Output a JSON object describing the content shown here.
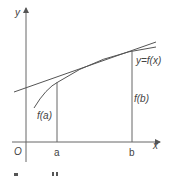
{
  "diagram": {
    "type": "secant-line-graph",
    "axes": {
      "x_label": "x",
      "y_label": "y",
      "origin_label": "O"
    },
    "points": {
      "a_label": "a",
      "b_label": "b"
    },
    "values": {
      "fa_label": "f(a)",
      "fb_label": "f(b)"
    },
    "curve_label": "y=f(x)",
    "colors": {
      "line": "#555555",
      "text": "#444444",
      "background": "#ffffff"
    }
  }
}
